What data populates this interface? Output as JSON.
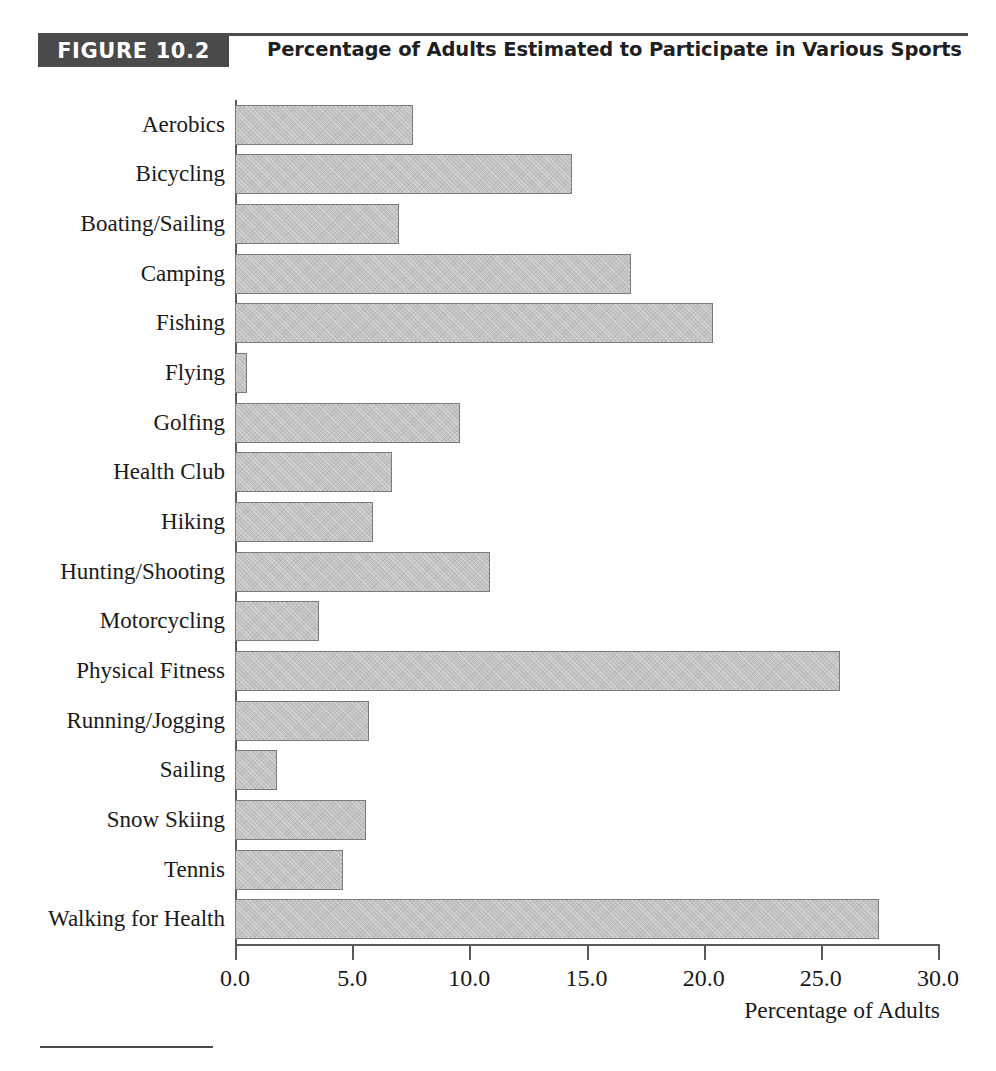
{
  "figure": {
    "number_label": "FIGURE 10.2",
    "title": "Percentage of Adults Estimated to Participate in Various Sports"
  },
  "chart_data": {
    "type": "bar",
    "orientation": "horizontal",
    "title": "Percentage of Adults Estimated to Participate in Various Sports",
    "xlabel": "Percentage of Adults",
    "ylabel": "",
    "xlim": [
      0.0,
      30.0
    ],
    "xticks": [
      "0.0",
      "5.0",
      "10.0",
      "15.0",
      "20.0",
      "25.0",
      "30.0"
    ],
    "xtick_values": [
      0.0,
      5.0,
      10.0,
      15.0,
      20.0,
      25.0,
      30.0
    ],
    "grid": false,
    "legend": false,
    "bar_fill_color": "#c2c2c2",
    "bar_border_color": "#7b7b7b",
    "categories": [
      "Aerobics",
      "Bicycling",
      "Boating/Sailing",
      "Camping",
      "Fishing",
      "Flying",
      "Golfing",
      "Health Club",
      "Hiking",
      "Hunting/Shooting",
      "Motorcycling",
      "Physical Fitness",
      "Running/Jogging",
      "Sailing",
      "Snow Skiing",
      "Tennis",
      "Walking for Health"
    ],
    "values": [
      7.6,
      14.4,
      7.0,
      16.9,
      20.4,
      0.5,
      9.6,
      6.7,
      5.9,
      10.9,
      3.6,
      25.8,
      5.7,
      1.8,
      5.6,
      4.6,
      27.5
    ]
  },
  "colors": {
    "header_band": "#4a4a4a",
    "header_text": "#ffffff",
    "rule": "#4d4d4d",
    "axis": "#5a5a5a",
    "text": "#1a1a1a"
  }
}
